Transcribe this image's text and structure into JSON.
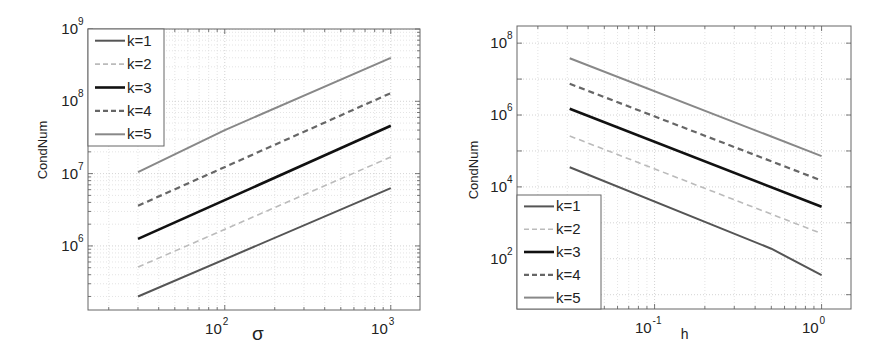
{
  "chart_data": [
    {
      "type": "line",
      "scale": {
        "x": "log",
        "y": "log"
      },
      "title": "",
      "xlabel": "σ",
      "ylabel": "CondNum",
      "xlim": [
        15,
        1500
      ],
      "ylim": [
        130000,
        1000000000
      ],
      "grid": true,
      "grid_minor": true,
      "legend_position": "upper-left",
      "x_ticks": [
        {
          "base": "10",
          "exp": "2",
          "value": 100
        },
        {
          "base": "10",
          "exp": "3",
          "value": 1000
        }
      ],
      "y_ticks": [
        {
          "base": "10",
          "exp": "6",
          "value": 1000000
        },
        {
          "base": "10",
          "exp": "7",
          "value": 10000000
        },
        {
          "base": "10",
          "exp": "8",
          "value": 100000000
        },
        {
          "base": "10",
          "exp": "9",
          "value": 1000000000
        }
      ],
      "x": [
        30,
        1000
      ],
      "series": [
        {
          "name": "k=1",
          "style": "solid",
          "color": "#555555",
          "width": 2,
          "points": [
            [
              30,
              200000
            ],
            [
              1000,
              6300000
            ]
          ]
        },
        {
          "name": "k=2",
          "style": "dashed",
          "color": "#bbbbbb",
          "width": 1.6,
          "points": [
            [
              30,
              510000
            ],
            [
              1000,
              17000000
            ]
          ]
        },
        {
          "name": "k=3",
          "style": "solid",
          "color": "#111111",
          "width": 2.6,
          "points": [
            [
              30,
              1250000
            ],
            [
              1000,
              46000000
            ]
          ]
        },
        {
          "name": "k=4",
          "style": "dashed",
          "color": "#666666",
          "width": 2.2,
          "points": [
            [
              30,
              3600000
            ],
            [
              1000,
              130000000
            ]
          ]
        },
        {
          "name": "k=5",
          "style": "solid",
          "color": "#888888",
          "width": 2,
          "points": [
            [
              30,
              10500000
            ],
            [
              100,
              40000000
            ],
            [
              1000,
              400000000
            ]
          ]
        }
      ]
    },
    {
      "type": "line",
      "scale": {
        "x": "log",
        "y": "log"
      },
      "title": "",
      "xlabel": "h",
      "ylabel": "CondNum",
      "xlim": [
        0.015,
        1.5
      ],
      "ylim": [
        4,
        300000000
      ],
      "grid": true,
      "grid_minor": true,
      "legend_position": "lower-left",
      "x_ticks": [
        {
          "base": "10",
          "exp": "-1",
          "value": 0.1
        },
        {
          "base": "10",
          "exp": "0",
          "value": 1
        }
      ],
      "y_ticks": [
        {
          "base": "10",
          "exp": "2",
          "value": 100
        },
        {
          "base": "10",
          "exp": "4",
          "value": 10000
        },
        {
          "base": "10",
          "exp": "6",
          "value": 1000000
        },
        {
          "base": "10",
          "exp": "8",
          "value": 100000000
        }
      ],
      "x": [
        0.031,
        1
      ],
      "series": [
        {
          "name": "k=1",
          "style": "solid",
          "color": "#555555",
          "width": 2,
          "points": [
            [
              0.031,
              35000
            ],
            [
              0.5,
              190
            ],
            [
              1,
              35
            ]
          ]
        },
        {
          "name": "k=2",
          "style": "dashed",
          "color": "#bbbbbb",
          "width": 1.6,
          "points": [
            [
              0.031,
              260000
            ],
            [
              1,
              500
            ]
          ]
        },
        {
          "name": "k=3",
          "style": "solid",
          "color": "#111111",
          "width": 2.6,
          "points": [
            [
              0.031,
              1500000
            ],
            [
              1,
              2800
            ]
          ]
        },
        {
          "name": "k=4",
          "style": "dashed",
          "color": "#666666",
          "width": 2.2,
          "points": [
            [
              0.031,
              7400000
            ],
            [
              1,
              15000
            ]
          ]
        },
        {
          "name": "k=5",
          "style": "solid",
          "color": "#888888",
          "width": 2,
          "points": [
            [
              0.031,
              38000000
            ],
            [
              1,
              72000
            ]
          ]
        }
      ]
    }
  ]
}
